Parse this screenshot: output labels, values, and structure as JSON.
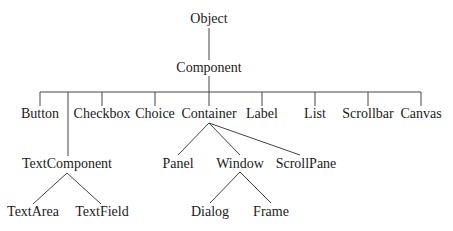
{
  "diagram": {
    "type": "class-hierarchy-tree",
    "line_color": "#444444",
    "text_color": "#1a1a1a",
    "nodes": {
      "object": {
        "label": "Object",
        "x": 209,
        "y": 11
      },
      "component": {
        "label": "Component",
        "x": 209,
        "y": 60
      },
      "button": {
        "label": "Button",
        "x": 40,
        "y": 106
      },
      "checkbox": {
        "label": "Checkbox",
        "x": 102,
        "y": 106
      },
      "choice": {
        "label": "Choice",
        "x": 155,
        "y": 106
      },
      "container": {
        "label": "Container",
        "x": 209,
        "y": 106
      },
      "label": {
        "label": "Label",
        "x": 262,
        "y": 106
      },
      "list": {
        "label": "List",
        "x": 315,
        "y": 106
      },
      "scrollbar": {
        "label": "Scrollbar",
        "x": 368,
        "y": 106
      },
      "canvas": {
        "label": "Canvas",
        "x": 421,
        "y": 106
      },
      "textcomponent": {
        "label": "TextComponent",
        "x": 67,
        "y": 156
      },
      "panel": {
        "label": "Panel",
        "x": 178,
        "y": 156
      },
      "window": {
        "label": "Window",
        "x": 240,
        "y": 156
      },
      "scrollpane": {
        "label": "ScrollPane",
        "x": 306,
        "y": 156
      },
      "textarea": {
        "label": "TextArea",
        "x": 33,
        "y": 204
      },
      "textfield": {
        "label": "TextField",
        "x": 102,
        "y": 204
      },
      "dialog": {
        "label": "Dialog",
        "x": 210,
        "y": 204
      },
      "frame": {
        "label": "Frame",
        "x": 271,
        "y": 204
      }
    },
    "edges": [
      {
        "from": "Object",
        "to": "Component"
      },
      {
        "from": "Component",
        "to": "Button"
      },
      {
        "from": "Component",
        "to": "TextComponent"
      },
      {
        "from": "Component",
        "to": "Checkbox"
      },
      {
        "from": "Component",
        "to": "Choice"
      },
      {
        "from": "Component",
        "to": "Container"
      },
      {
        "from": "Component",
        "to": "Label"
      },
      {
        "from": "Component",
        "to": "List"
      },
      {
        "from": "Component",
        "to": "Scrollbar"
      },
      {
        "from": "Component",
        "to": "Canvas"
      },
      {
        "from": "TextComponent",
        "to": "TextArea"
      },
      {
        "from": "TextComponent",
        "to": "TextField"
      },
      {
        "from": "Container",
        "to": "Panel"
      },
      {
        "from": "Container",
        "to": "Window"
      },
      {
        "from": "Container",
        "to": "ScrollPane"
      },
      {
        "from": "Window",
        "to": "Dialog"
      },
      {
        "from": "Window",
        "to": "Frame"
      }
    ]
  }
}
